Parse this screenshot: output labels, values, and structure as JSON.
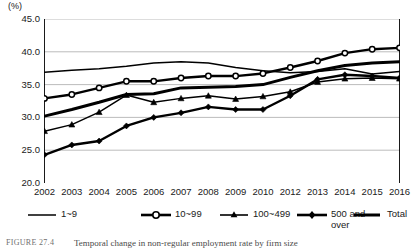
{
  "chart_data": {
    "type": "line",
    "title": "",
    "xlabel": "",
    "ylabel": "(%)",
    "unit_label": "(%)",
    "ylim": [
      20.0,
      45.0
    ],
    "yticks": [
      "20.0",
      "25.0",
      "30.0",
      "35.0",
      "40.0",
      "45.0"
    ],
    "ytick_values": [
      20.0,
      25.0,
      30.0,
      35.0,
      40.0,
      45.0
    ],
    "grid": true,
    "legend_position": "below",
    "categories": [
      "2002",
      "2003",
      "2004",
      "2005",
      "2006",
      "2007",
      "2008",
      "2009",
      "2010",
      "2012",
      "2013",
      "2014",
      "2015",
      "2016"
    ],
    "series": [
      {
        "name": "1~9",
        "marker": "none",
        "style": "thin-line",
        "values": [
          36.9,
          37.2,
          37.4,
          37.8,
          38.3,
          38.5,
          38.3,
          37.6,
          37.1,
          36.8,
          37.0,
          37.4,
          36.6,
          37.0
        ]
      },
      {
        "name": "10~99",
        "marker": "circle",
        "style": "thick-line-open-marker",
        "values": [
          32.9,
          33.5,
          34.5,
          35.5,
          35.5,
          36.0,
          36.3,
          36.3,
          36.7,
          37.6,
          38.6,
          39.8,
          40.4,
          40.6
        ]
      },
      {
        "name": "100~499",
        "marker": "triangle",
        "style": "thin-line-filled-marker",
        "values": [
          27.9,
          28.9,
          30.8,
          33.4,
          32.3,
          32.9,
          33.3,
          32.8,
          33.2,
          33.9,
          35.4,
          35.9,
          36.0,
          35.9
        ]
      },
      {
        "name": "500 and over",
        "marker": "diamond",
        "style": "thick-line-filled-marker",
        "values": [
          24.3,
          25.8,
          26.4,
          28.7,
          30.0,
          30.7,
          31.6,
          31.2,
          31.2,
          33.3,
          35.8,
          36.5,
          36.3,
          36.0
        ]
      },
      {
        "name": "Total",
        "marker": "none",
        "style": "extra-thick-line",
        "values": [
          30.2,
          31.2,
          32.3,
          33.5,
          33.6,
          34.5,
          34.6,
          34.7,
          35.0,
          36.1,
          37.1,
          37.9,
          38.3,
          38.5
        ]
      }
    ],
    "colors": {
      "line": "#000000",
      "grid": "#b4b4b4",
      "axis": "#000000",
      "background": "#ffffff"
    }
  },
  "legend": {
    "items": [
      {
        "label": "1~9",
        "marker": "none"
      },
      {
        "label": "10~99",
        "marker": "circle"
      },
      {
        "label": "100~499",
        "marker": "triangle"
      },
      {
        "label": "500 and over",
        "marker": "diamond"
      },
      {
        "label": "Total",
        "marker": "none"
      }
    ]
  },
  "caption": {
    "number": "FIGURE 27.4",
    "text": "Temporal change in non-regular employment rate by firm size"
  }
}
